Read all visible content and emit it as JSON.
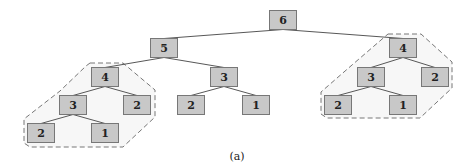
{
  "figure": {
    "caption": "(a)",
    "node_fill": "#c8c8c8",
    "node_stroke": "#777777",
    "edge_color": "#444444",
    "hull_stroke": "#777777",
    "hull_fill": "#f7f7f7"
  },
  "nodes": [
    {
      "id": "n6",
      "label": "6",
      "x": 283,
      "y": 20
    },
    {
      "id": "n5",
      "label": "5",
      "x": 164,
      "y": 48
    },
    {
      "id": "n4a",
      "label": "4",
      "x": 105,
      "y": 77
    },
    {
      "id": "n3b",
      "label": "3",
      "x": 224,
      "y": 77
    },
    {
      "id": "n3a",
      "label": "3",
      "x": 73,
      "y": 105
    },
    {
      "id": "n2a",
      "label": "2",
      "x": 137,
      "y": 105
    },
    {
      "id": "n2b",
      "label": "2",
      "x": 41,
      "y": 133
    },
    {
      "id": "n1a",
      "label": "1",
      "x": 105,
      "y": 133
    },
    {
      "id": "n2c",
      "label": "2",
      "x": 191,
      "y": 105
    },
    {
      "id": "n1b",
      "label": "1",
      "x": 256,
      "y": 105
    },
    {
      "id": "n4r",
      "label": "4",
      "x": 403,
      "y": 48
    },
    {
      "id": "n3r",
      "label": "3",
      "x": 371,
      "y": 77
    },
    {
      "id": "n2r",
      "label": "2",
      "x": 435,
      "y": 77
    },
    {
      "id": "n2rr",
      "label": "2",
      "x": 338,
      "y": 105
    },
    {
      "id": "n1r",
      "label": "1",
      "x": 403,
      "y": 105
    }
  ],
  "edges": [
    [
      "n6",
      "n5"
    ],
    [
      "n6",
      "n4r"
    ],
    [
      "n5",
      "n4a"
    ],
    [
      "n5",
      "n3b"
    ],
    [
      "n4a",
      "n3a"
    ],
    [
      "n4a",
      "n2a"
    ],
    [
      "n3a",
      "n2b"
    ],
    [
      "n3a",
      "n1a"
    ],
    [
      "n3b",
      "n2c"
    ],
    [
      "n3b",
      "n1b"
    ],
    [
      "n4r",
      "n3r"
    ],
    [
      "n4r",
      "n2r"
    ],
    [
      "n3r",
      "n2rr"
    ],
    [
      "n3r",
      "n1r"
    ]
  ],
  "hulls": [
    {
      "id": "hull-left",
      "points": "90,63 123,63 155,90 155,117 123,147 30,147 24,143 24,119 60,91 86,66"
    },
    {
      "id": "hull-right",
      "points": "388,34 421,34 452,62 452,88 420,118 327,118 321,114 321,92 352,65"
    }
  ]
}
